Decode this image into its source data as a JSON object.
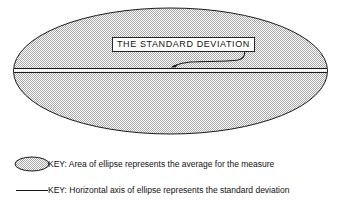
{
  "figure": {
    "type": "statistical-ellipse-diagram",
    "background_color": "#ffffff",
    "ink_color": "#111111"
  },
  "diagram": {
    "ellipse": {
      "name": "main-ellipse",
      "fill_description": "stippled gray halftone",
      "fill_color": "#c9c9c9",
      "outline_color": "#1a1a1a",
      "center_x": 170.5,
      "center_y": 71,
      "radius_x": 157,
      "radius_y": 63
    },
    "horizontal_axis": {
      "name": "horizontal-axis-line",
      "color": "#1a1a1a",
      "y": 71,
      "x_start": 14,
      "x_end": 327
    },
    "callout": {
      "label": "THE  STANDARD  DEVIATION",
      "box_border_color": "#262626",
      "box_fill_color": "#ffffff",
      "leader_color": "#1a1a1a",
      "arrow_target_x": 171,
      "arrow_target_y": 67
    }
  },
  "legend": {
    "rows": [
      {
        "swatch": "filled-ellipse-swatch",
        "text": "KEY: Area of ellipse represents the average for the measure"
      },
      {
        "swatch": "horizontal-line-swatch",
        "text": "KEY: Horizontal axis of ellipse represents the standard deviation"
      }
    ]
  }
}
